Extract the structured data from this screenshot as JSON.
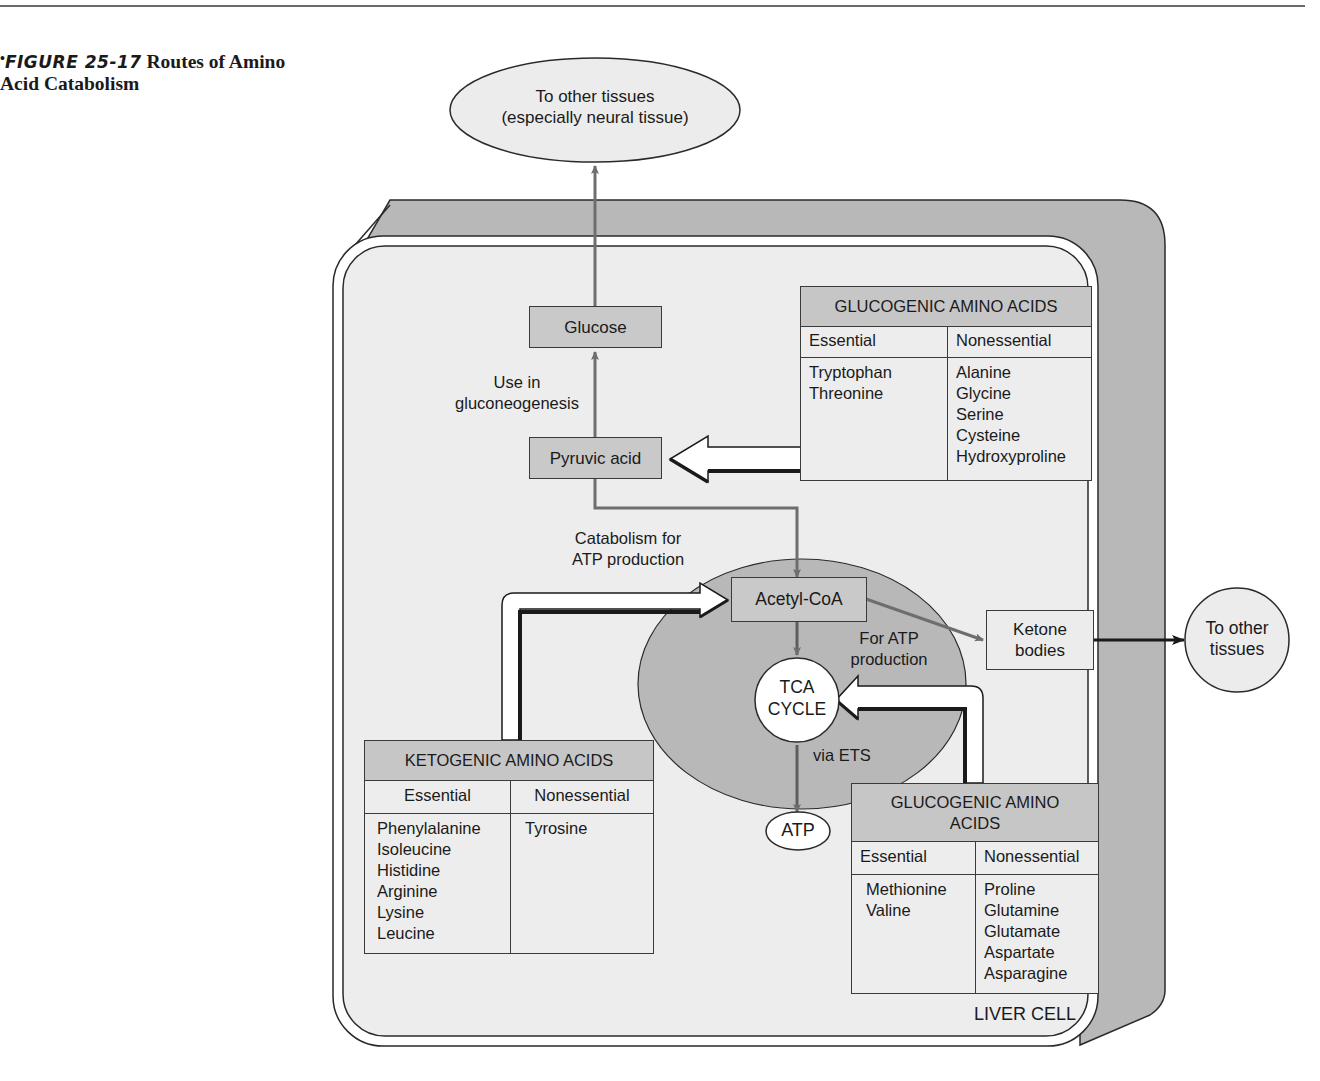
{
  "figure": {
    "bullet": "•",
    "number": "FIGURE 25-17",
    "title_line1": "Routes of Amino",
    "title_line2": "Acid Catabolism"
  },
  "nodes": {
    "to_other_tissues_top": {
      "line1": "To other tissues",
      "line2": "(especially neural tissue)"
    },
    "glucose": "Glucose",
    "pyruvic_acid": "Pyruvic acid",
    "acetyl_coa": "Acetyl-CoA",
    "tca_cycle": {
      "line1": "TCA",
      "line2": "CYCLE"
    },
    "atp": "ATP",
    "ketone_bodies": {
      "line1": "Ketone",
      "line2": "bodies"
    },
    "to_other_tissues_right": {
      "line1": "To other",
      "line2": "tissues"
    },
    "liver_cell": "LIVER CELL"
  },
  "edge_labels": {
    "gluconeogenesis": {
      "line1": "Use in",
      "line2": "gluconeogenesis"
    },
    "catabolism": {
      "line1": "Catabolism for",
      "line2": "ATP production"
    },
    "for_atp": {
      "line1": "For ATP",
      "line2": "production"
    },
    "via_ets": "via ETS"
  },
  "tables": {
    "glucogenic_top": {
      "title": "GLUCOGENIC AMINO ACIDS",
      "columns": [
        "Essential",
        "Nonessential"
      ],
      "essential": [
        "Tryptophan",
        "Threonine"
      ],
      "nonessential": [
        "Alanine",
        "Glycine",
        "Serine",
        "Cysteine",
        "Hydroxyproline"
      ]
    },
    "ketogenic": {
      "title": "KETOGENIC AMINO ACIDS",
      "columns": [
        "Essential",
        "Nonessential"
      ],
      "essential": [
        "Phenylalanine",
        "Isoleucine",
        "Histidine",
        "Arginine",
        "Lysine",
        "Leucine"
      ],
      "nonessential": [
        "Tyrosine"
      ]
    },
    "glucogenic_bottom": {
      "title_line1": "GLUCOGENIC AMINO",
      "title_line2": "ACIDS",
      "columns": [
        "Essential",
        "Nonessential"
      ],
      "essential": [
        "Methionine",
        "Valine"
      ],
      "nonessential": [
        "Proline",
        "Glutamine",
        "Glutamate",
        "Aspartate",
        "Asparagine"
      ]
    }
  },
  "colors": {
    "cell_shadow": "#b5b5b5",
    "cell_fill": "#efefef",
    "mitochondrion": "#b8b8b8",
    "box_gray": "#c9c9c9",
    "arrow_gray": "#6e6e6e",
    "outline": "#2a2a2a"
  }
}
